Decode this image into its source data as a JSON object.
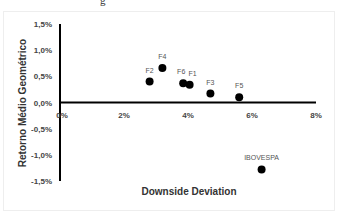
{
  "chart_data": {
    "type": "scatter",
    "title": "",
    "xlabel": "Downside Deviation",
    "ylabel": "Retorno Médio Geométrico",
    "xlim": [
      0,
      8
    ],
    "ylim": [
      -1.5,
      1.5
    ],
    "x_ticks": [
      "0%",
      "2%",
      "4%",
      "6%",
      "8%"
    ],
    "y_ticks": [
      "1,5%",
      "1,0%",
      "0,5%",
      "0,0%",
      "-0,5%",
      "-1,0%",
      "-1,5%"
    ],
    "grid": false,
    "legend": "none",
    "points": [
      {
        "label": "F2",
        "x": 2.8,
        "y": 0.4
      },
      {
        "label": "F4",
        "x": 3.2,
        "y": 0.66
      },
      {
        "label": "F6",
        "x": 3.85,
        "y": 0.37
      },
      {
        "label": "F1",
        "x": 4.05,
        "y": 0.34
      },
      {
        "label": "F3",
        "x": 4.7,
        "y": 0.17
      },
      {
        "label": "F5",
        "x": 5.6,
        "y": 0.1
      },
      {
        "label": "IBOVESPA",
        "x": 6.3,
        "y": -1.28
      }
    ]
  },
  "caption_fragment": "g"
}
